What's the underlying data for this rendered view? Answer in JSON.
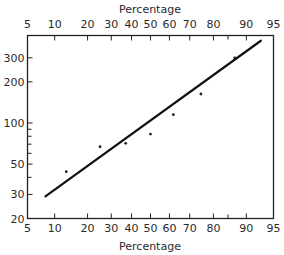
{
  "chart_data": {
    "type": "scatter",
    "title": "",
    "xlabel": "Percentage",
    "x2label": "Percentage",
    "ylabel": "",
    "x_scale": "normal-probability",
    "y_scale": "log",
    "xlim": [
      5,
      95
    ],
    "ylim": [
      20,
      400
    ],
    "grid": false,
    "legend": null,
    "x_ticks": [
      5,
      10,
      20,
      30,
      40,
      50,
      60,
      70,
      80,
      90,
      95
    ],
    "x_tick_labels": [
      "5",
      "10",
      "20",
      "30",
      "40",
      "50",
      "60",
      "70",
      "80",
      "90",
      "95"
    ],
    "x_minor_ticks": [
      85
    ],
    "y_ticks": [
      20,
      30,
      50,
      100,
      200,
      300
    ],
    "y_tick_labels": [
      "20",
      "30",
      "50",
      "100",
      "200",
      "300"
    ],
    "y_minor_ticks": [
      40,
      60,
      70,
      80,
      90
    ],
    "series": [
      {
        "name": "observations",
        "kind": "points",
        "x": [
          13,
          25,
          37,
          50,
          62,
          75,
          87
        ],
        "y": [
          44,
          67,
          71,
          83,
          115,
          163,
          300
        ]
      },
      {
        "name": "fitted line",
        "kind": "line",
        "x": [
          8,
          93
        ],
        "y": [
          29,
          400
        ]
      }
    ]
  }
}
